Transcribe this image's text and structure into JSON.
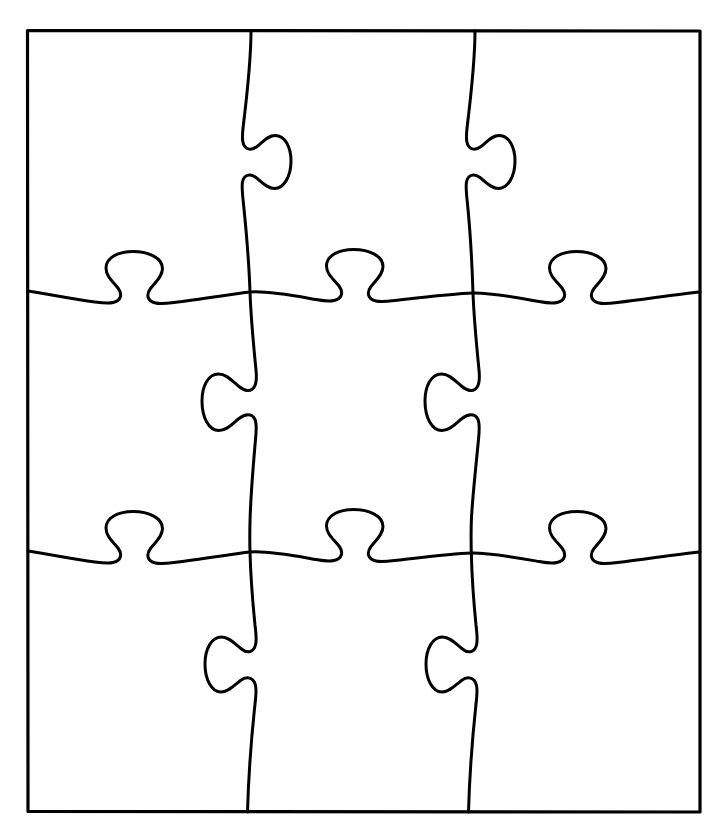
{
  "document": {
    "title": "Jigsaw Puzzle Outline",
    "kind": "line-art-diagram",
    "description": "Blank three-by-three jigsaw puzzle template drawn as black outlines on a white background",
    "canvas": {
      "width": 726,
      "height": 837,
      "background_color": "#ffffff"
    }
  },
  "style": {
    "stroke_color": "#000000",
    "fill_color": "none",
    "border_stroke_width": 3.2,
    "divider_stroke_width": 3.0
  },
  "puzzle": {
    "name": "jigsaw-puzzle",
    "rows": 3,
    "columns": 3,
    "piece_count": 9,
    "frame": {
      "name": "outer-border",
      "left": 27,
      "top": 30,
      "right": 700,
      "bottom": 812,
      "width": 673,
      "height": 782
    },
    "vertical_dividers": [
      {
        "name": "vertical-divider-left",
        "index": 1,
        "x_top": 251,
        "x_bottom": 247,
        "tabs": [
          {
            "row": 1,
            "direction": "right",
            "center_y": 155
          },
          {
            "row": 2,
            "direction": "left",
            "center_y": 418
          },
          {
            "row": 3,
            "direction": "right",
            "center_y": 678
          }
        ]
      },
      {
        "name": "vertical-divider-right",
        "index": 2,
        "x_top": 475,
        "x_bottom": 469,
        "tabs": [
          {
            "row": 1,
            "direction": "right",
            "center_y": 155
          },
          {
            "row": 2,
            "direction": "left",
            "center_y": 418
          },
          {
            "row": 3,
            "direction": "right",
            "center_y": 678
          }
        ]
      }
    ],
    "horizontal_dividers": [
      {
        "name": "horizontal-divider-top",
        "index": 1,
        "y_left": 291,
        "y_right": 293,
        "tabs": [
          {
            "column": 1,
            "direction": "up",
            "center_x": 145
          },
          {
            "column": 2,
            "direction": "up",
            "center_x": 362
          },
          {
            "column": 3,
            "direction": "up",
            "center_x": 586
          }
        ]
      },
      {
        "name": "horizontal-divider-bottom",
        "index": 2,
        "y_left": 551,
        "y_right": 553,
        "tabs": [
          {
            "column": 1,
            "direction": "up",
            "center_x": 145
          },
          {
            "column": 2,
            "direction": "up",
            "center_x": 362
          },
          {
            "column": 3,
            "direction": "up",
            "center_x": 586
          }
        ]
      }
    ],
    "intersections": [
      {
        "name": "intersection-1-1",
        "x": 250,
        "y": 292
      },
      {
        "name": "intersection-1-2",
        "x": 473,
        "y": 293
      },
      {
        "name": "intersection-2-1",
        "x": 250,
        "y": 552
      },
      {
        "name": "intersection-2-2",
        "x": 471,
        "y": 553
      }
    ],
    "pieces": [
      {
        "name": "piece-r1c1",
        "row": 1,
        "column": 1,
        "label": ""
      },
      {
        "name": "piece-r1c2",
        "row": 1,
        "column": 2,
        "label": ""
      },
      {
        "name": "piece-r1c3",
        "row": 1,
        "column": 3,
        "label": ""
      },
      {
        "name": "piece-r2c1",
        "row": 2,
        "column": 1,
        "label": ""
      },
      {
        "name": "piece-r2c2",
        "row": 2,
        "column": 2,
        "label": ""
      },
      {
        "name": "piece-r2c3",
        "row": 2,
        "column": 3,
        "label": ""
      },
      {
        "name": "piece-r3c1",
        "row": 3,
        "column": 1,
        "label": ""
      },
      {
        "name": "piece-r3c2",
        "row": 3,
        "column": 2,
        "label": ""
      },
      {
        "name": "piece-r3c3",
        "row": 3,
        "column": 3,
        "label": ""
      }
    ],
    "paths": {
      "outer_border": "M27.5,30.5 L700,31 L700,812 L28,811.5 Z",
      "vertical_divider_left": "M251,31 C251,60 247,95 243.5,124 C242.5,132 242,137.5 242.8,141.5 C244.5,150 251,151 257,146.5 C264,141 268,135.5 275,135.5 C285,135.5 291,147 291,161 C291,176 284,188.5 274.5,188.5 C267,188.5 262,182 256,177.5 C250,173 243.5,174.5 242.4,182.5 C241.8,187 242.3,193 243.2,201 C246,228 249,262 250,292 C251,320 254,350 256,370 C256.8,378 256.5,383 254.5,386.5 C251,392.5 244.5,391 239,386.5 C232,381 226.5,374 218.5,374 C208,374 202,386.5 202,401 C202,417 208.5,430.5 219,430.5 C227,430.5 232.5,423.5 239,418.5 C245,414 251.5,413 254.8,419 C256.5,422.5 256.5,428 255.8,436 C253.5,462 250.5,500 250,522 C249.7,533 249.8,545 250,552 C250.5,572 253,605 255,625 C256,633 256.5,639 255.8,643.5 C254.3,652.5 247.5,654 241.5,649 C234.5,643.5 229,637 221.5,637 C211.5,637 205,649 205,664 C205,679.5 211.5,692 221,692 C228.5,692 234,685.5 240.5,680.5 C246.5,676 253.5,677 255.5,685.5 C256.5,690 256,696 255,704 C252,732 248.5,775 247.5,812",
      "vertical_divider_right": "M475,31 C475,60 471,95 467.5,124 C466.5,132 466,137.5 466.8,141.5 C468.5,150 475,151 481,146.5 C488,141 492,135.5 499,135.5 C509,135.5 515,147 515,161 C515,176 508,188.5 498.5,188.5 C491,188.5 486,182 480,177.5 C474,173 467.5,174.5 466.4,182.5 C465.8,187 466.3,193 467.2,201 C470,228 472,262 473,293 C474,320 477,350 479,370 C479.8,378 479.5,383 477.5,386.5 C474,392.5 467.5,391 462,386.5 C455,381 449.5,374 441.5,374 C431,374 425,386.5 425,401 C425,417 431.5,430.5 442,430.5 C450,430.5 455.5,423.5 462,418.5 C468,414 474.5,413 477.8,419 C479.5,422.5 479.5,428 478.8,436 C476.5,462 472,500 471.3,522 C471,533 471.1,545 471.3,553 C471.8,573 474,605 476,625 C477,633 477.5,639 476.8,643.5 C475.3,652.5 468.5,654 462.5,649 C455.5,643.5 450,637 442.5,637 C432.5,637 426,649 426,664 C426,679.5 432.5,692 442,692 C449.5,692 455,685.5 461.5,680.5 C467.5,676 474.5,677 476.5,685.5 C477.5,690 477,696 476,704 C473,732 469.5,775 468.5,812",
      "horizontal_divider_top": "M28,291 C48,294 72,299 95,302 C103,303 109,303.5 113,302.5 C121.5,300.5 122.5,294 118,288 C112.5,281 106,276 106,268 C106,257.5 118.5,251.5 133,251.5 C149,251.5 162.5,258 162.5,268.5 C162.5,276.5 155.5,282 150.5,288.5 C146,294.5 147,301 155.5,303 C160,304 166,303.5 174,302.5 C201,299.5 232,294 250,292 C268,290.5 296,296 316,299.5 C324,301 330,301.5 334,300.5 C342.5,298.5 343.5,292 339,286 C333.5,279 326.5,274 326.5,266 C326.5,255.5 339,249.5 353.5,249.5 C369.5,249.5 383,256 383,266.5 C383,274.5 376,280 371,286.5 C366.5,292.5 367.5,299 376,301 C380.5,302 386.5,301.5 394.5,300.5 C421,297.5 455,293.5 473,293 C491,292.5 519,298 539,301.5 C547,303 553,303.5 557,302.5 C565.5,300.5 566.5,294 562,288 C556.5,281 549.5,276 549.5,268 C549.5,257.5 562,251.5 576.5,251.5 C592.5,251.5 606,258 606,268.5 C606,276.5 599,282 594,288.5 C589.5,294.5 590.5,301 599,303 C603.5,304 609.5,303.5 617.5,302.5 C644,299.5 678,294 700,292",
      "horizontal_divider_bottom": "M28,551 C48,554 72,559 95,562 C103,563 109,563.5 113,562.5 C121.5,560.5 122.5,554 118,548 C112.5,541 106,536 106,528 C106,517.5 118.5,511.5 133,511.5 C149,511.5 162.5,518 162.5,528.5 C162.5,536.5 155.5,542 150.5,548.5 C146,554.5 147,561 155.5,563 C160,564 166,563.5 174,562.5 C201,559.5 232,554 250,552 C268,550.5 296,556 316,559.5 C324,561 330,561.5 334,560.5 C342.5,558.5 343.5,552 339,546 C333.5,539 326.5,534 326.5,526 C326.5,515.5 339,509.5 353.5,509.5 C369.5,509.5 383,516 383,526.5 C383,534.5 376,540 371,546.5 C366.5,552.5 367.5,559 376,561 C380.5,562 386.5,561.5 394.5,560.5 C421,557.5 453,553.5 471,553 C489,552.5 519,558 539,561.5 C547,563 553,563.5 557,562.5 C565.5,560.5 566.5,554 562,548 C556.5,541 549.5,536 549.5,528 C549.5,517.5 562,511.5 576.5,511.5 C592.5,511.5 606,518 606,528.5 C606,536.5 599,542 594,548.5 C589.5,554.5 590.5,561 599,563 C603.5,564 609.5,563.5 617.5,562.5 C644,559.5 678,554 700,552"
    }
  }
}
